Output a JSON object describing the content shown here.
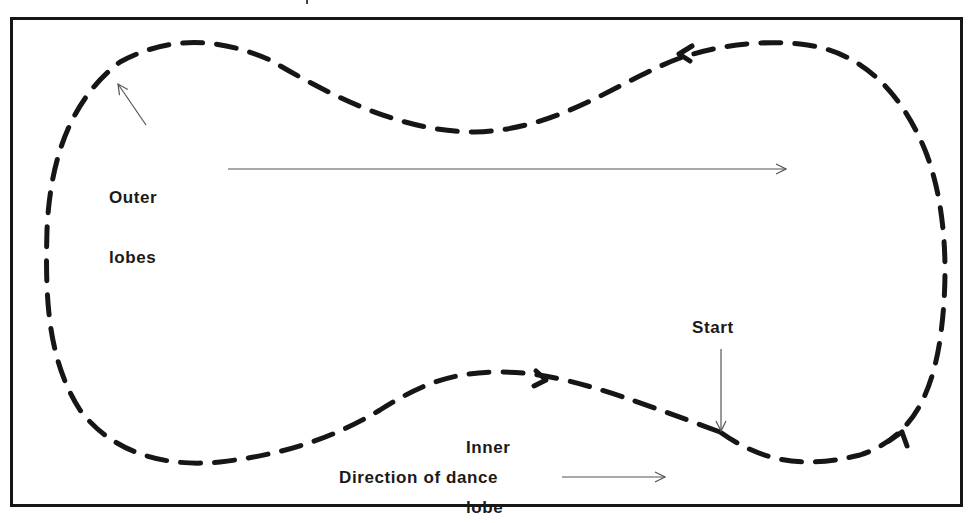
{
  "diagram": {
    "type": "dance-floor-pattern",
    "labels": {
      "outer_lobes_line1": "Outer",
      "outer_lobes_line2": "lobes",
      "inner_lobe_line1": "Inner",
      "inner_lobe_line2": "lobe",
      "start": "Start",
      "direction": "Direction of dance"
    },
    "colors": {
      "ink": "#161616",
      "pointer": "#555555",
      "background": "#ffffff"
    },
    "path_direction": "clockwise-on-screen, anticlockwise around floor relative to direction of dance",
    "arrowheads_on_path": [
      "top-right heading left",
      "bottom-middle heading right",
      "bottom-right heading up"
    ]
  }
}
